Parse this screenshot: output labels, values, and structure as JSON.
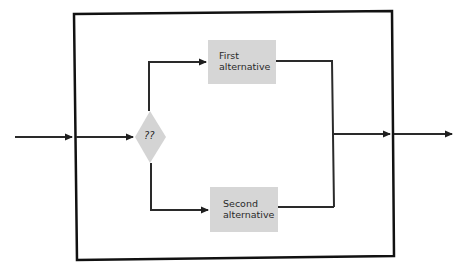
{
  "diagram": {
    "type": "flowchart",
    "decision": {
      "label": "??",
      "shape": "diamond"
    },
    "branches": [
      {
        "id": "first",
        "line1": "First",
        "line2": "alternative"
      },
      {
        "id": "second",
        "line1": "Second",
        "line2": "alternative"
      }
    ],
    "colors": {
      "line": "#1f1f1f",
      "box_fill": "#d6d6d6",
      "diamond_fill": "#d4d4d4",
      "frame": "#111111",
      "background": "#ffffff"
    }
  }
}
